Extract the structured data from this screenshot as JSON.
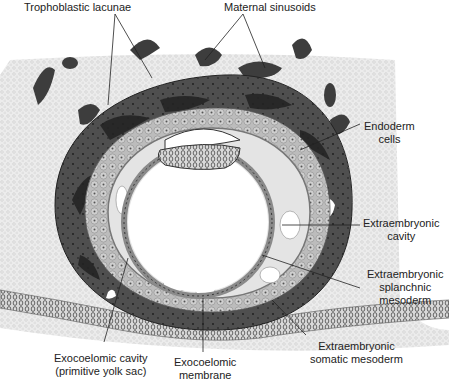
{
  "figure": {
    "labels": {
      "trophoblastic_lacunae": "Trophoblastic lacunae",
      "maternal_sinusoids": "Maternal sinusoids",
      "endoderm_cells": "Endoderm\ncells",
      "extraembryonic_cavity": "Extraembryonic\ncavity",
      "extraembryonic_splanchnic_mesoderm": "Extraembryonic\nsplanchnic\nmesoderm",
      "extraembryonic_somatic_mesoderm": "Extraembryonic\nsomatic mesoderm",
      "exocoelomic_cavity": "Exocoelomic cavity\n(primitive yolk sac)",
      "exocoelomic_membrane": "Exocoelomic\nmembrane"
    },
    "colors": {
      "endometrium": "#e9e9e9",
      "syncytiotrophoblast": "#4a4a4a",
      "lacunae": "#2e2e2e",
      "cytotrophoblast": "#bdbdbd",
      "mesoderm": "#d6d6d6",
      "membrane": "#8a8a8a",
      "cavity": "#ffffff"
    }
  }
}
